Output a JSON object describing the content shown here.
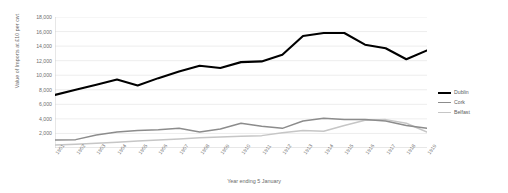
{
  "chart_data": {
    "type": "line",
    "title": "",
    "xlabel": "Year ending 5 January",
    "ylabel": "Value of Imports at £10 per cwt",
    "ylim": [
      0,
      18000
    ],
    "yticks": [
      0,
      2000,
      4000,
      6000,
      8000,
      10000,
      12000,
      14000,
      16000,
      18000
    ],
    "ytick_labels": [
      "",
      "2,000",
      "4,000",
      "6,000",
      "8,000",
      "10,000",
      "12,000",
      "14,000",
      "16,000",
      "18,000"
    ],
    "grid": true,
    "grid_axis": "y",
    "legend_position": "right",
    "categories": [
      "1901",
      "1902",
      "1903",
      "1904",
      "1905",
      "1906",
      "1907",
      "1908",
      "1909",
      "1910",
      "1911",
      "1912",
      "1913",
      "1914",
      "1915",
      "1916",
      "1917",
      "1918",
      "1919"
    ],
    "series": [
      {
        "name": "Dublin",
        "color": "#000000",
        "width": 2.1,
        "values": [
          7300,
          8000,
          8700,
          9400,
          8600,
          9600,
          10500,
          11300,
          11000,
          11800,
          11900,
          12800,
          15400,
          15800,
          15800,
          14200,
          13700,
          12200,
          13400
        ]
      },
      {
        "name": "Cork",
        "color": "#8c8c8c",
        "width": 1.5,
        "values": [
          1100,
          1150,
          1800,
          2200,
          2400,
          2500,
          2700,
          2200,
          2600,
          3400,
          3000,
          2700,
          3700,
          4100,
          3900,
          3900,
          3700,
          3100,
          2700
        ]
      },
      {
        "name": "Belfast",
        "color": "#c6c6c6",
        "width": 1.5,
        "values": [
          400,
          500,
          650,
          800,
          950,
          1100,
          1250,
          1400,
          1500,
          1600,
          1700,
          2100,
          2400,
          2300,
          3100,
          3800,
          3900,
          3400,
          2200
        ]
      }
    ]
  },
  "legend": {
    "items": [
      {
        "label": "Dublin"
      },
      {
        "label": "Cork"
      },
      {
        "label": "Belfast"
      }
    ]
  },
  "axes": {
    "x_title": "Year ending 5 January",
    "y_title": "Value of Imports at £10 per cwt"
  }
}
